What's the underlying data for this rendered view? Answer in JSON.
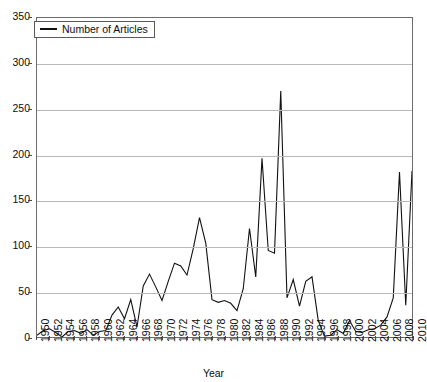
{
  "chart_data": {
    "type": "line",
    "title": "",
    "xlabel": "Year",
    "ylabel": "",
    "xlim": [
      1950,
      2010
    ],
    "ylim": [
      0,
      350
    ],
    "grid": true,
    "legend_position": "top-left",
    "yticks": [
      0,
      50,
      100,
      150,
      200,
      250,
      300,
      350
    ],
    "xticks": [
      1950,
      1952,
      1954,
      1956,
      1958,
      1960,
      1962,
      1964,
      1966,
      1968,
      1970,
      1972,
      1974,
      1976,
      1978,
      1980,
      1982,
      1984,
      1986,
      1988,
      1990,
      1992,
      1994,
      1996,
      1998,
      2000,
      2002,
      2004,
      2006,
      2008,
      2010
    ],
    "series": [
      {
        "name": "Number of Articles",
        "color": "#111111",
        "x": [
          1950,
          1951,
          1952,
          1953,
          1954,
          1955,
          1956,
          1957,
          1958,
          1959,
          1960,
          1961,
          1962,
          1963,
          1964,
          1965,
          1966,
          1967,
          1968,
          1969,
          1970,
          1971,
          1972,
          1973,
          1974,
          1975,
          1976,
          1977,
          1978,
          1979,
          1980,
          1981,
          1982,
          1983,
          1984,
          1985,
          1986,
          1987,
          1988,
          1989,
          1990,
          1991,
          1992,
          1993,
          1994,
          1995,
          1996,
          1997,
          1998,
          1999,
          2000,
          2001,
          2002,
          2003,
          2004,
          2005,
          2006,
          2007,
          2008,
          2009,
          2010
        ],
        "values": [
          2,
          7,
          9,
          5,
          0,
          6,
          7,
          4,
          8,
          2,
          6,
          7,
          24,
          33,
          20,
          41,
          11,
          56,
          69,
          55,
          40,
          61,
          81,
          78,
          68,
          97,
          131,
          103,
          41,
          38,
          40,
          37,
          29,
          53,
          119,
          66,
          196,
          95,
          92,
          270,
          43,
          63,
          34,
          61,
          66,
          18,
          1,
          2,
          8,
          4,
          18,
          6,
          5,
          8,
          9,
          13,
          22,
          43,
          181,
          35,
          182
        ]
      }
    ]
  },
  "legend": {
    "entries": [
      {
        "label": "Number of Articles"
      }
    ]
  },
  "axes": {
    "x_title": "Year"
  }
}
